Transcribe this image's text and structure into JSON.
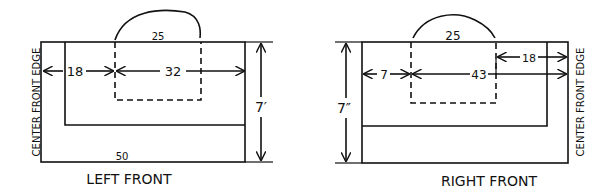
{
  "left": {
    "title": "LEFT FRONT",
    "edge_label": "CENTER FRONT EDGE",
    "top_label": "25",
    "bottom_label": "50",
    "dim_left": "18",
    "dim_right": "32",
    "height_label": "7′"
  },
  "right": {
    "title": "RIGHT FRONT",
    "edge_label": "CENTER FRONT EDGE",
    "top_label": "25",
    "dim_left": "7",
    "dim_mid": "43",
    "dim_upper": "18",
    "height_label": "7″"
  },
  "colors": {
    "ink": "#111111",
    "paper": "#ffffff"
  }
}
